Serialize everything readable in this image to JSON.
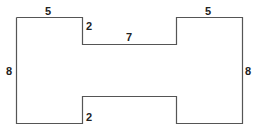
{
  "diagram": {
    "type": "rectilinear-shape-dimensions",
    "stroke_color": "#555555",
    "labels": {
      "top_left_width": "5",
      "top_left_notch_height": "2",
      "top_middle_width": "7",
      "top_right_width": "5",
      "left_height": "8",
      "right_height": "8",
      "bottom_notch_height": "2"
    }
  }
}
